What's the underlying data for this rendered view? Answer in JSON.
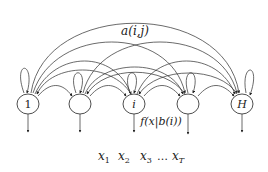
{
  "diagram": {
    "type": "hmm-state-diagram",
    "transition_label": "a(i,j)",
    "emission_label": "f(x|b(i))",
    "nodes": [
      {
        "id": "n1",
        "label": "1",
        "cx": 28
      },
      {
        "id": "n2",
        "label": "",
        "cx": 80
      },
      {
        "id": "n3",
        "label": "i",
        "cx": 134
      },
      {
        "id": "n4",
        "label": "",
        "cx": 188
      },
      {
        "id": "n5",
        "label": "H",
        "cx": 242
      }
    ],
    "observations": {
      "items": [
        "x",
        "x",
        "x",
        "x"
      ],
      "subscripts": [
        "1",
        "2",
        "3",
        "T"
      ],
      "ellipsis": "…"
    },
    "colors": {
      "stroke": "#3a3a3a",
      "text": "#222222",
      "background": "#ffffff"
    }
  }
}
